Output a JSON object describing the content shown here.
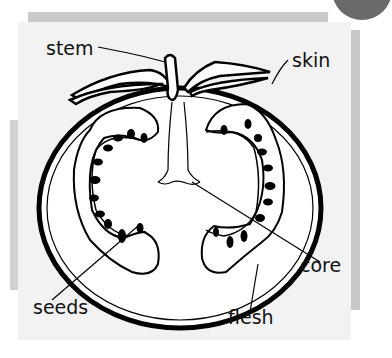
{
  "diagram": {
    "labels": {
      "stem": "stem",
      "skin": "skin",
      "core": "core",
      "seeds": "seeds",
      "flesh": "flesh"
    }
  },
  "colors": {
    "card": "#f2f2f2",
    "shadow": "#c9c9c9",
    "ink": "#111111",
    "corner": "#6a6a6a"
  }
}
